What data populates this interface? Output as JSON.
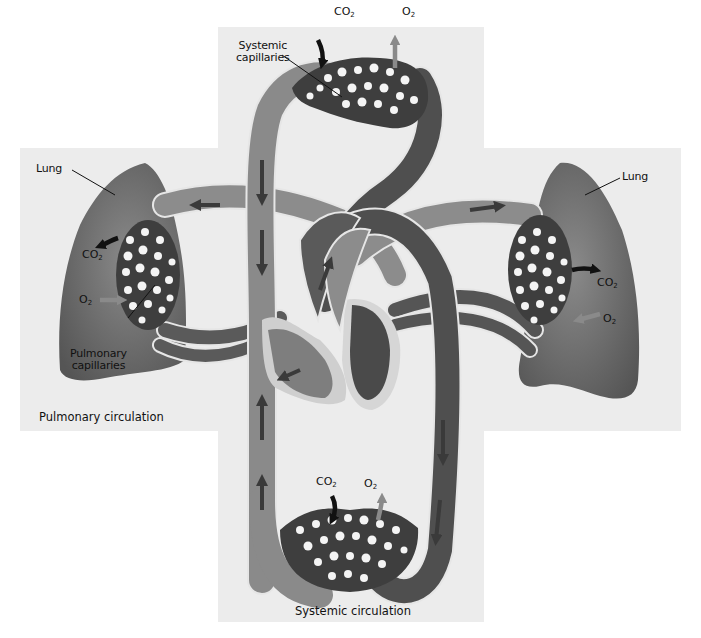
{
  "diagram": {
    "labels": {
      "systemic_capillaries": [
        "Systemic",
        "capillaries"
      ],
      "pulmonary_capillaries": [
        "Pulmonary",
        "capillaries"
      ],
      "lung_left": "Lung",
      "lung_right": "Lung"
    },
    "captions": {
      "pulmonary": "Pulmonary circulation",
      "systemic": "Systemic circulation"
    },
    "gases": {
      "top_co2": {
        "base": "CO",
        "sub": "2"
      },
      "top_o2": {
        "base": "O",
        "sub": "2"
      },
      "left_co2": {
        "base": "CO",
        "sub": "2"
      },
      "left_o2": {
        "base": "O",
        "sub": "2"
      },
      "right_co2": {
        "base": "CO",
        "sub": "2"
      },
      "right_o2": {
        "base": "O",
        "sub": "2"
      },
      "bottom_co2": {
        "base": "CO",
        "sub": "2"
      },
      "bottom_o2": {
        "base": "O",
        "sub": "2"
      }
    },
    "colors": {
      "background_panel": "#ececec",
      "lung": "#6a6a6a",
      "oxygenated_vessel": "#8c8c8c",
      "deoxygenated_vessel": "#4f4f4f",
      "capillary_bed": "#3e3e3e",
      "flow_arrow": "#3a3a3a",
      "co2_arrow": "#111111",
      "o2_arrow": "#8a8a8a",
      "heart_wall": "#c9c9c9"
    }
  }
}
